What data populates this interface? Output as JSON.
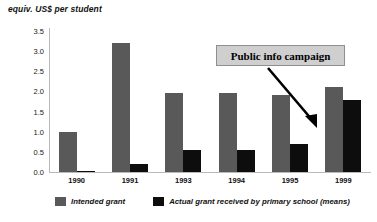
{
  "chart_data": {
    "type": "bar",
    "title": "equiv. US$ per student",
    "xlabel": "",
    "ylabel": "equiv. US$ per student",
    "categories": [
      "1990",
      "1991",
      "1993",
      "1994",
      "1995",
      "1999"
    ],
    "series": [
      {
        "name": "Intended grant",
        "color": "#595959",
        "values": [
          1.0,
          3.2,
          1.95,
          1.95,
          1.9,
          2.1
        ]
      },
      {
        "name": "Actual grant received by primary school (means)",
        "color": "#0d0d0d",
        "values": [
          0.02,
          0.2,
          0.55,
          0.55,
          0.7,
          1.8
        ]
      }
    ],
    "ylim": [
      0.0,
      3.5
    ],
    "yticks": [
      "3.5",
      "3.0",
      "2.5",
      "2.0",
      "1.5",
      "1.0",
      "0.5",
      "0.0"
    ],
    "ytick_values": [
      3.5,
      3.0,
      2.5,
      2.0,
      1.5,
      1.0,
      0.5,
      0.0
    ],
    "grid": false,
    "legend_position": "bottom",
    "annotations": [
      {
        "text": "Public info campaign",
        "kind": "boxed-label-with-arrow",
        "box_color": "#cfcfcf",
        "points_to": "1995"
      }
    ]
  },
  "legend": {
    "items": [
      {
        "label": "Intended grant",
        "swatch": "intended"
      },
      {
        "label": "Actual grant received by primary school (means)",
        "swatch": "actual"
      }
    ]
  }
}
